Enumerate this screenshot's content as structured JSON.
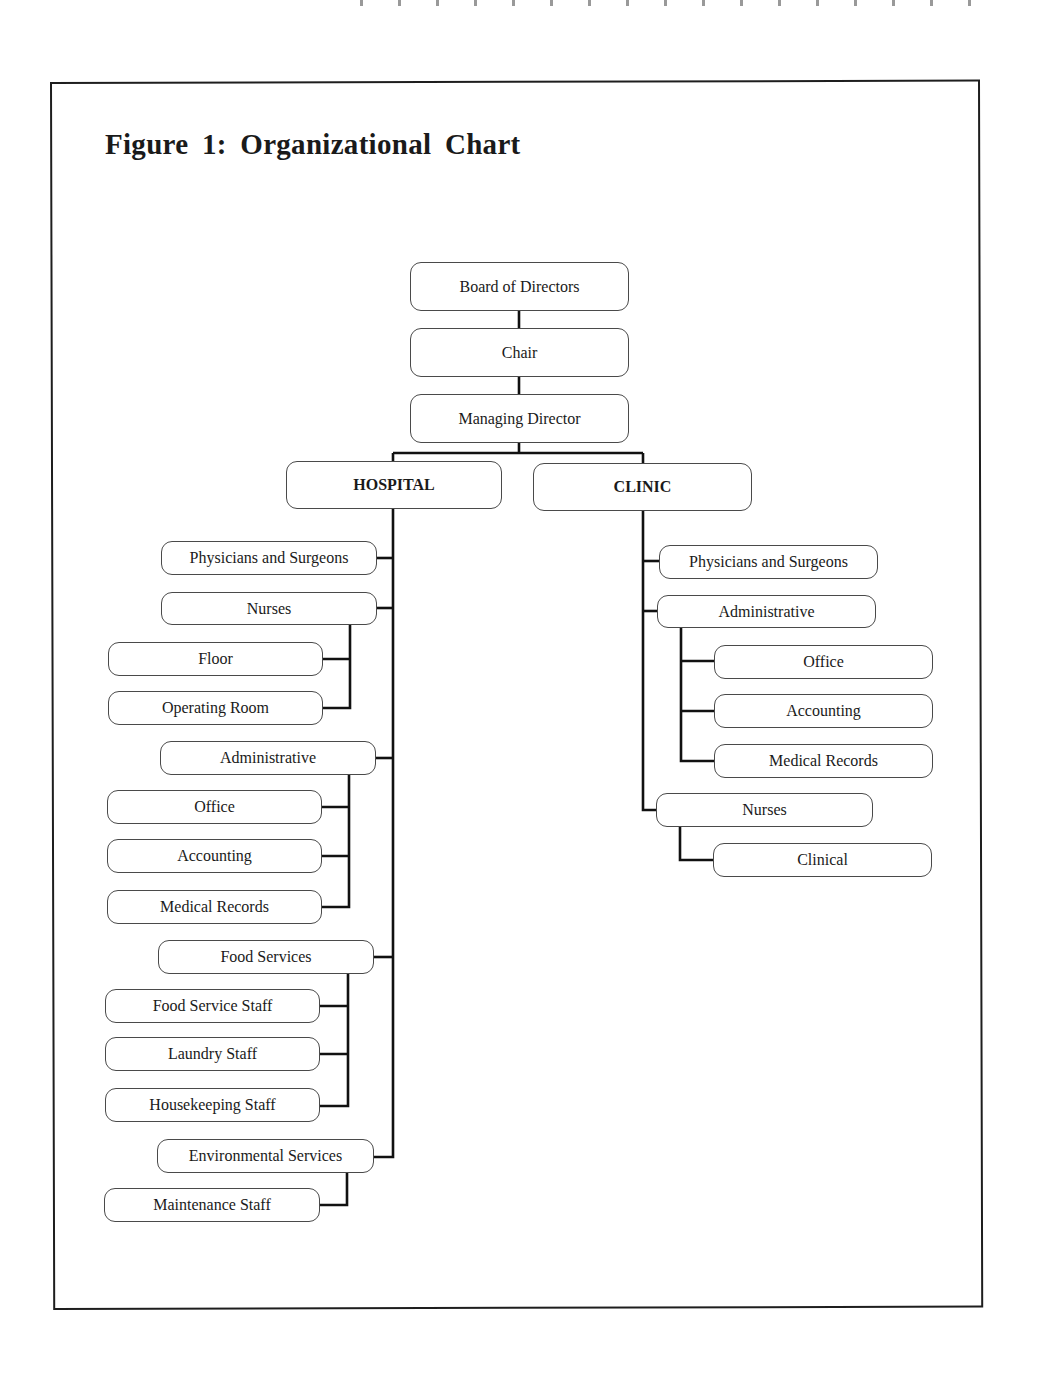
{
  "figure": {
    "title": "Figure 1: Organizational Chart"
  },
  "top": {
    "board": "Board of Directors",
    "chair": "Chair",
    "managing_director": "Managing Director"
  },
  "hospital": {
    "label": "HOSPITAL",
    "physicians": "Physicians and Surgeons",
    "nurses": {
      "label": "Nurses",
      "children": [
        "Floor",
        "Operating Room"
      ]
    },
    "administrative": {
      "label": "Administrative",
      "children": [
        "Office",
        "Accounting",
        "Medical Records"
      ]
    },
    "food_services": {
      "label": "Food Services",
      "children": [
        "Food Service Staff",
        "Laundry Staff",
        "Housekeeping Staff"
      ]
    },
    "environmental_services": {
      "label": "Environmental Services",
      "children": [
        "Maintenance  Staff"
      ]
    }
  },
  "clinic": {
    "label": "CLINIC",
    "physicians": "Physicians and Surgeons",
    "administrative": {
      "label": "Administrative",
      "children": [
        "Office",
        "Accounting",
        "Medical Records"
      ]
    },
    "nurses": {
      "label": "Nurses",
      "children": [
        "Clinical"
      ]
    }
  }
}
